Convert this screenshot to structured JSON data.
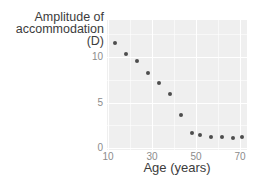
{
  "chart": {
    "y_axis_title_lines": [
      "Amplitude of",
      "accommodation",
      "(D)"
    ],
    "x_axis_title": "Age (years)"
  },
  "chart_data": {
    "type": "scatter",
    "title": "",
    "xlabel": "Age (years)",
    "ylabel": "Amplitude of accommodation (D)",
    "x_ticks": [
      10,
      30,
      50,
      70
    ],
    "x_minor_ticks": [
      20,
      40,
      60
    ],
    "y_ticks": [
      0,
      5,
      10
    ],
    "y_minor_ticks": [
      2.5,
      7.5,
      12.5
    ],
    "xlim": [
      9.5,
      73
    ],
    "ylim": [
      -0.2,
      14.2
    ],
    "grid": "major and minor white gridlines on gray panel",
    "legend": "none",
    "series": [
      {
        "name": "amplitude-vs-age",
        "points": [
          {
            "age": 13,
            "amplitude": 11.5
          },
          {
            "age": 18,
            "amplitude": 10.3
          },
          {
            "age": 23,
            "amplitude": 9.6
          },
          {
            "age": 28,
            "amplitude": 8.2
          },
          {
            "age": 33,
            "amplitude": 7.1
          },
          {
            "age": 38,
            "amplitude": 5.9
          },
          {
            "age": 43,
            "amplitude": 3.6
          },
          {
            "age": 48,
            "amplitude": 1.7
          },
          {
            "age": 52,
            "amplitude": 1.4
          },
          {
            "age": 57,
            "amplitude": 1.2
          },
          {
            "age": 62,
            "amplitude": 1.2
          },
          {
            "age": 67,
            "amplitude": 1.1
          },
          {
            "age": 71,
            "amplitude": 1.2
          }
        ]
      }
    ],
    "colors": {
      "figure_background": "#ffffff",
      "panel_background": "#efefef",
      "gridline_major": "#ffffff",
      "gridline_minor": "rgba(255,255,255,0.55)",
      "point": "#4d4d4d",
      "tick_label": "#8c8c8c",
      "axis_title": "#3c3c3c"
    }
  }
}
